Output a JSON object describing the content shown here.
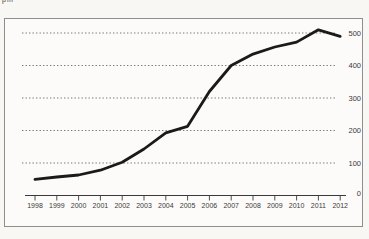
{
  "page": {
    "clipped_top_label": "pm",
    "background": "#f8f7f4",
    "frame_border_color": "#8e8e8e"
  },
  "chart_data": {
    "type": "line",
    "title": "",
    "xlabel": "",
    "ylabel": "",
    "x": [
      "1998",
      "1999",
      "2000",
      "2001",
      "2002",
      "2003",
      "2004",
      "2005",
      "2006",
      "2007",
      "2008",
      "2009",
      "2010",
      "2011",
      "2012"
    ],
    "values": [
      50,
      57,
      63,
      78,
      102,
      143,
      193,
      213,
      320,
      400,
      435,
      457,
      472,
      510,
      490
    ],
    "y_ticks": [
      0,
      100,
      200,
      300,
      400,
      500
    ],
    "ylim": [
      0,
      530
    ],
    "grid": "dotted-horizontal",
    "y_axis_side": "right",
    "legend": "none",
    "line_color": "#1a1a1a",
    "gridline_color": "#6a6a6a",
    "axis_color": "#3a3a3a"
  }
}
